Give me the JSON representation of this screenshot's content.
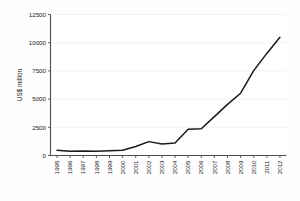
{
  "chart_data": {
    "type": "line",
    "title": "",
    "subtitle": "",
    "xlabel": "",
    "ylabel": "US$ million",
    "categories": [
      "1995",
      "1996",
      "1997",
      "1998",
      "1999",
      "2000",
      "2001",
      "2002",
      "2003",
      "2004",
      "2005",
      "2006",
      "2007",
      "2008",
      "2009",
      "2010",
      "2011",
      "2012"
    ],
    "values": [
      460,
      380,
      390,
      370,
      420,
      470,
      800,
      1230,
      1010,
      1110,
      2320,
      2370,
      3450,
      4530,
      5520,
      7520,
      9050,
      10480
    ],
    "series": [
      {
        "name": "US$ million",
        "values": [
          460,
          380,
          390,
          370,
          420,
          470,
          800,
          1230,
          1010,
          1110,
          2320,
          2370,
          3450,
          4530,
          5520,
          7520,
          9050,
          10480
        ]
      }
    ],
    "ylim": [
      0,
      12500
    ],
    "yticks": [
      0,
      2500,
      5000,
      7500,
      10000,
      12500
    ],
    "ytick_labels": [
      "0",
      "2500",
      "5000",
      "7500",
      "10000",
      "12500"
    ],
    "xticks": [
      "1995",
      "1996",
      "1997",
      "1998",
      "1999",
      "2000",
      "2001",
      "2002",
      "2003",
      "2004",
      "2005",
      "2006",
      "2007",
      "2008",
      "2009",
      "2010",
      "2011",
      "2012"
    ],
    "grid": true,
    "grid_axis": "y",
    "legend": false,
    "legend_position": "none",
    "line_color": "#1a1a1a",
    "grid_color": "#e9e9e9",
    "axis_color": "#4d4d4d",
    "background_color": "#ffffff",
    "xtick_rotation": -90
  }
}
